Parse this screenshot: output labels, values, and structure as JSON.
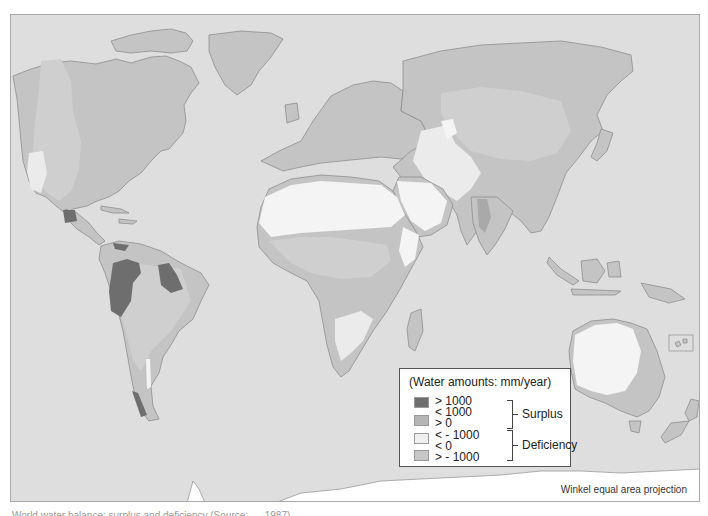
{
  "map": {
    "projection_label": "Winkel equal area projection",
    "caption_partial": "World water balance: surplus and deficiency (Source: ..., 1987)",
    "colors": {
      "ocean": "#dedede",
      "surplus_gt_1000": "#6e6e6e",
      "surplus_0_1000": "#a9a9a9",
      "deficiency_lt_minus_1000": "#f4f4f4",
      "deficiency_minus_1000_0": "#cfcfcf",
      "land_base": "#c4c4c4",
      "ice": "#ffffff"
    }
  },
  "legend": {
    "title": "(Water amounts: mm/year)",
    "items": [
      {
        "label": "> 1000",
        "color": "#6e6e6e"
      },
      {
        "label": "< 1000",
        "color": "#b5b5b5"
      },
      {
        "label": "> 0",
        "color": ""
      },
      {
        "label": "< - 1000",
        "color": "#efefef"
      },
      {
        "label": "< 0",
        "color": "#c6c6c6"
      },
      {
        "label": "> - 1000",
        "color": ""
      }
    ],
    "groups": [
      {
        "label": "Surplus"
      },
      {
        "label": "Deficiency"
      }
    ]
  }
}
